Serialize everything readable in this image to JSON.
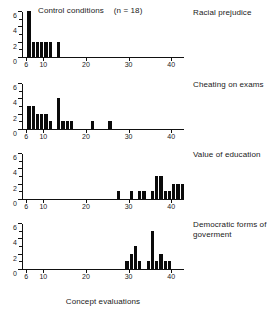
{
  "figure": {
    "title_text": "Control conditions",
    "n_text": "(n = 18)",
    "x_axis_caption": "Concept evaluations"
  },
  "chart_data": {
    "type": "bar",
    "xlabel": "Concept evaluations",
    "ylabel": "",
    "xlim": [
      5,
      43
    ],
    "ylim": [
      0,
      6
    ],
    "grid": false,
    "legend": "none",
    "x_ticks": [
      "6",
      "10",
      "20",
      "30",
      "40"
    ],
    "x_tick_values": [
      6,
      10,
      20,
      30,
      40
    ],
    "y_ticks": [
      "0",
      "2",
      "4",
      "6"
    ],
    "y_tick_values": [
      0,
      2,
      4,
      6
    ],
    "bin_width": 1,
    "panels": [
      {
        "label": "Racial prejudice",
        "bins": [
          6,
          7,
          8,
          9,
          10,
          11,
          12,
          13
        ],
        "values": [
          6,
          2,
          2,
          2,
          2,
          2,
          0,
          2
        ]
      },
      {
        "label": "Cheating on exams",
        "bins": [
          6,
          7,
          8,
          9,
          10,
          11,
          12,
          13,
          14,
          15,
          16,
          21,
          25
        ],
        "values": [
          3,
          3,
          2,
          2,
          2,
          1,
          0,
          4,
          1,
          1,
          1,
          1,
          1
        ]
      },
      {
        "label": "Value of education",
        "bins": [
          27,
          30,
          32,
          33,
          35,
          36,
          37,
          38,
          39,
          40,
          41,
          42
        ],
        "values": [
          1,
          1,
          1,
          1,
          1,
          3,
          3,
          1,
          1,
          2,
          2,
          2
        ]
      },
      {
        "label": "Democratic forms of goverment",
        "bins": [
          29,
          30,
          31,
          32,
          33,
          34,
          35,
          36,
          37,
          38,
          39,
          40
        ],
        "values": [
          1,
          2,
          3,
          1,
          0,
          1,
          5,
          1,
          2,
          1,
          1,
          0
        ]
      }
    ]
  }
}
